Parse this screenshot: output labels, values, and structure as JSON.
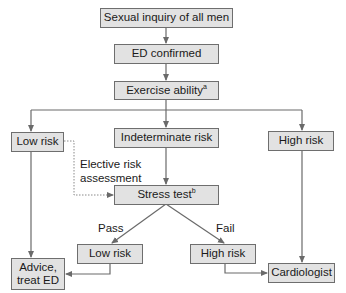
{
  "diagram": {
    "type": "flowchart",
    "nodes": {
      "sexual_inquiry": "Sexual inquiry of all men",
      "ed_confirmed": "ED confirmed",
      "exercise_ability": "Exercise ability",
      "exercise_ability_sup": "a",
      "low_risk_initial": "Low risk",
      "indeterminate_risk": "Indeterminate risk",
      "high_risk_initial": "High risk",
      "stress_test": "Stress test",
      "stress_test_sup": "b",
      "low_risk_after_test": "Low risk",
      "high_risk_after_test": "High risk",
      "advice_line1": "Advice,",
      "advice_line2": "treat ED",
      "cardiologist": "Cardiologist"
    },
    "edge_labels": {
      "elective_line1": "Elective risk",
      "elective_line2": "assessment",
      "pass": "Pass",
      "fail": "Fail"
    },
    "edges": [
      {
        "from": "Sexual inquiry of all men",
        "to": "ED confirmed",
        "style": "solid"
      },
      {
        "from": "ED confirmed",
        "to": "Exercise ability",
        "style": "solid"
      },
      {
        "from": "Exercise ability",
        "to": "Low risk",
        "style": "solid"
      },
      {
        "from": "Exercise ability",
        "to": "Indeterminate risk",
        "style": "solid"
      },
      {
        "from": "Exercise ability",
        "to": "High risk",
        "style": "solid"
      },
      {
        "from": "Low risk",
        "to": "Stress test",
        "style": "dotted",
        "label": "Elective risk assessment"
      },
      {
        "from": "Indeterminate risk",
        "to": "Stress test",
        "style": "solid"
      },
      {
        "from": "Stress test",
        "to": "Low risk (after test)",
        "style": "solid",
        "label": "Pass"
      },
      {
        "from": "Stress test",
        "to": "High risk (after test)",
        "style": "solid",
        "label": "Fail"
      },
      {
        "from": "Low risk",
        "to": "Advice, treat ED",
        "style": "solid"
      },
      {
        "from": "Low risk (after test)",
        "to": "Advice, treat ED",
        "style": "solid"
      },
      {
        "from": "High risk (after test)",
        "to": "Cardiologist",
        "style": "solid"
      },
      {
        "from": "High risk",
        "to": "Cardiologist",
        "style": "solid"
      }
    ],
    "colors": {
      "box_fill": "#e2e2e2",
      "box_border": "#6e6e6e",
      "line": "#6a6a6a",
      "text": "#1a1a1a"
    }
  }
}
